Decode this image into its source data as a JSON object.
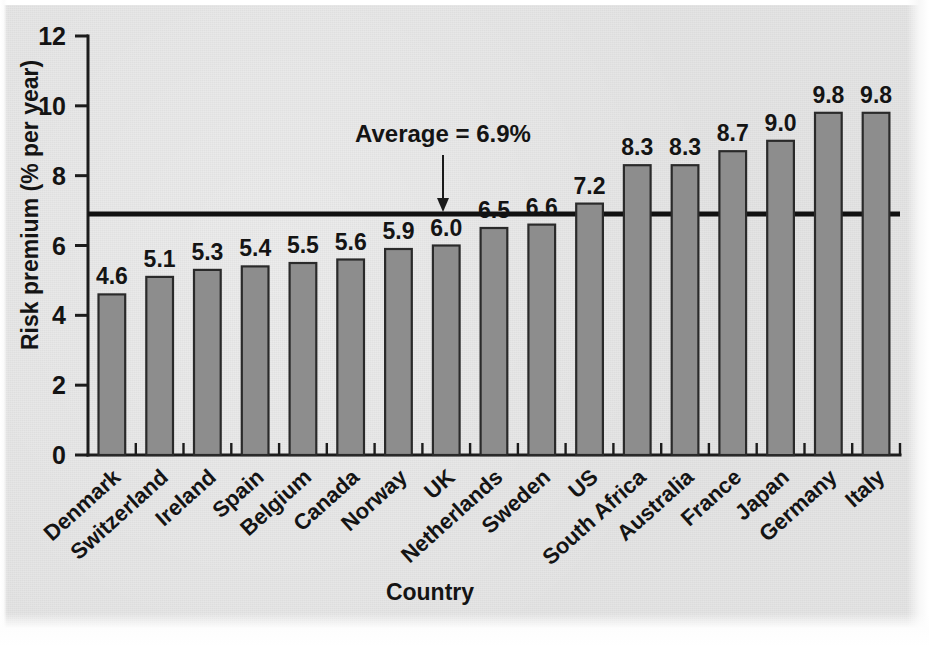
{
  "chart_data": {
    "type": "bar",
    "title": "",
    "xlabel": "Country",
    "ylabel": "Risk premium (% per year)",
    "categories": [
      "Denmark",
      "Switzerland",
      "Ireland",
      "Spain",
      "Belgium",
      "Canada",
      "Norway",
      "UK",
      "Netherlands",
      "Sweden",
      "US",
      "South Africa",
      "Australia",
      "France",
      "Japan",
      "Germany",
      "Italy"
    ],
    "values": [
      4.6,
      5.1,
      5.3,
      5.4,
      5.5,
      5.6,
      5.9,
      6.0,
      6.5,
      6.6,
      7.2,
      8.3,
      8.3,
      8.7,
      9.0,
      9.8,
      9.8
    ],
    "value_labels": [
      "4.6",
      "5.1",
      "5.3",
      "5.4",
      "5.5",
      "5.6",
      "5.9",
      "6.0",
      "6.5",
      "6.6",
      "7.2",
      "8.3",
      "8.3",
      "8.7",
      "9.0",
      "9.8",
      "9.8"
    ],
    "ylim": [
      0,
      12
    ],
    "yticks": [
      0,
      2,
      4,
      6,
      8,
      10,
      12
    ],
    "ytick_labels": [
      "0",
      "2",
      "4",
      "6",
      "8",
      "10",
      "12"
    ],
    "grid": false,
    "legend": "none",
    "annotations": [
      {
        "name": "average-line",
        "label": "Average = 6.9%",
        "value": 6.9,
        "kind": "horizontal-reference-line-with-arrow"
      }
    ],
    "colors": {
      "bar_fill": "#8d8d8d",
      "bar_stroke": "#2a2a2a",
      "axis": "#1c1c1c",
      "average_line": "#111111",
      "background": "#e4e4e4",
      "text": "#141414"
    }
  }
}
